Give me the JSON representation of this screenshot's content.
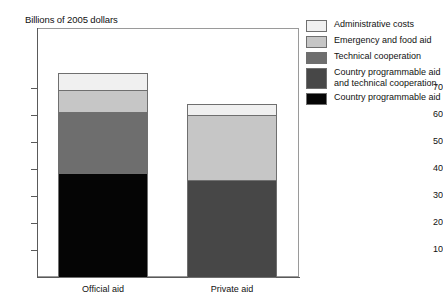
{
  "chart_data": {
    "type": "bar",
    "subtype": "stacked-bar",
    "title": "",
    "ylabel": "Billions of 2005 dollars",
    "xlabel": "",
    "categories": [
      "Official aid",
      "Private aid"
    ],
    "ylim": [
      0,
      78
    ],
    "yticks": [
      10,
      20,
      30,
      40,
      50,
      60,
      70
    ],
    "ytick_labels": [
      "10",
      "20",
      "30",
      "40",
      "50",
      "60",
      "70"
    ],
    "grid": false,
    "legend_position": "right",
    "series": [
      {
        "name": "Country programmable aid",
        "color": "#050505",
        "values": [
          38.5,
          0
        ]
      },
      {
        "name": "Country programmable aid and technical cooperation",
        "color": "#474747",
        "values": [
          0,
          36.0
        ]
      },
      {
        "name": "Technical cooperation",
        "color": "#6e6e6e",
        "values": [
          22.5,
          0
        ]
      },
      {
        "name": "Emergency and food aid",
        "color": "#c6c6c6",
        "values": [
          8.0,
          24.0
        ]
      },
      {
        "name": "Administrative costs",
        "color": "#f0f0f0",
        "values": [
          6.5,
          4.0
        ]
      }
    ],
    "totals": [
      75.5,
      64.0
    ],
    "annotations": []
  },
  "axis": {
    "y_title": "Billions of 2005 dollars",
    "y_ticks": [
      "70",
      "60",
      "50",
      "40",
      "30",
      "20",
      "10"
    ],
    "x_labels": [
      "Official aid",
      "Private aid"
    ]
  },
  "legend": {
    "items": [
      {
        "label": "Administrative costs",
        "color": "#f0f0f0"
      },
      {
        "label": "Emergency and food aid",
        "color": "#c6c6c6"
      },
      {
        "label": "Technical cooperation",
        "color": "#6e6e6e"
      },
      {
        "label": "Country programmable aid\nand technical cooperation",
        "color": "#474747"
      },
      {
        "label": "Country programmable aid",
        "color": "#050505"
      }
    ]
  },
  "bars": {
    "official": {
      "label": "Official aid",
      "segments": [
        {
          "name": "Administrative costs",
          "value": 6.5,
          "color": "#f0f0f0"
        },
        {
          "name": "Emergency and food aid",
          "value": 8.0,
          "color": "#c6c6c6"
        },
        {
          "name": "Technical cooperation",
          "value": 22.5,
          "color": "#6e6e6e"
        },
        {
          "name": "Country programmable aid",
          "value": 38.5,
          "color": "#050505"
        }
      ],
      "total": 75.5
    },
    "private": {
      "label": "Private aid",
      "segments": [
        {
          "name": "Administrative costs",
          "value": 4.0,
          "color": "#f0f0f0"
        },
        {
          "name": "Emergency and food aid",
          "value": 24.0,
          "color": "#c6c6c6"
        },
        {
          "name": "Country programmable aid and technical cooperation",
          "value": 36.0,
          "color": "#474747"
        }
      ],
      "total": 64.0
    }
  }
}
